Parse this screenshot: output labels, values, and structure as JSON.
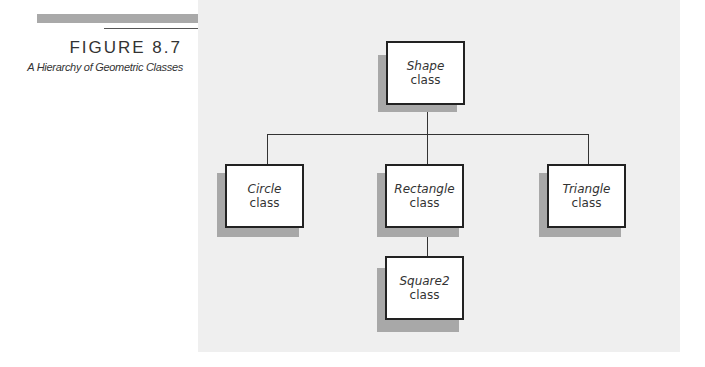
{
  "figure": {
    "label": "FIGURE 8.7",
    "caption": "A Hierarchy of Geometric Classes"
  },
  "diagram": {
    "type": "class-hierarchy",
    "nodes": [
      {
        "id": "shape",
        "name": "Shape",
        "kind": "class"
      },
      {
        "id": "circle",
        "name": "Circle",
        "kind": "class"
      },
      {
        "id": "rectangle",
        "name": "Rectangle",
        "kind": "class"
      },
      {
        "id": "triangle",
        "name": "Triangle",
        "kind": "class"
      },
      {
        "id": "square2",
        "name": "Square2",
        "kind": "class"
      }
    ],
    "edges": [
      {
        "from": "shape",
        "to": "circle"
      },
      {
        "from": "shape",
        "to": "rectangle"
      },
      {
        "from": "shape",
        "to": "triangle"
      },
      {
        "from": "rectangle",
        "to": "square2"
      }
    ]
  }
}
